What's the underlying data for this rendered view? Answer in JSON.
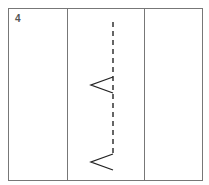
{
  "step": {
    "number": "4"
  },
  "diagram": {
    "frame": {
      "x": 8,
      "y": 8,
      "width": 194,
      "height": 172,
      "stroke": "#777777"
    },
    "panel_dividers": [
      67,
      144
    ],
    "fold_line": {
      "x": 113,
      "y_start": 22,
      "y_end": 157,
      "style": "dashed",
      "stroke": "#333333"
    },
    "chevrons": [
      {
        "tip_x": 91,
        "tip_y": 85,
        "direction": "left"
      },
      {
        "tip_x": 91,
        "tip_y": 162,
        "direction": "left"
      }
    ]
  }
}
